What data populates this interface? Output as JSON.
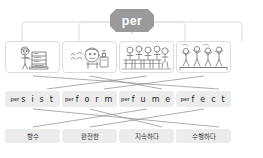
{
  "root": {
    "label": "per",
    "badge_color": "#9a9a9a",
    "badge_text_color": "#ffffff"
  },
  "pictures": [
    {
      "name": "picture-persist",
      "alt": "child studying at a desk"
    },
    {
      "name": "picture-perfume",
      "alt": "person smelling perfume bottle"
    },
    {
      "name": "picture-perfect",
      "alt": "students in a classroom"
    },
    {
      "name": "picture-perform",
      "alt": "people performing on stage"
    }
  ],
  "words": [
    {
      "prefix": "per",
      "stem": "s i s t",
      "full": "persist"
    },
    {
      "prefix": "per",
      "stem": "f o r m",
      "full": "perform"
    },
    {
      "prefix": "per",
      "stem": "f u m e",
      "full": "perfume"
    },
    {
      "prefix": "per",
      "stem": "f e c t",
      "full": "perfect"
    }
  ],
  "meanings": [
    {
      "label": "향수"
    },
    {
      "label": "완전한"
    },
    {
      "label": "지속하다"
    },
    {
      "label": "수행하다"
    }
  ],
  "chip_color": "#ececec",
  "line_color": "#8a8a8a"
}
